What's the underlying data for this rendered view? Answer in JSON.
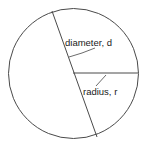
{
  "figure": {
    "background_color": "#ffffff",
    "stroke_color": "#4a4a4a",
    "text_color": "#1a1a1a",
    "width": 149,
    "height": 149,
    "circle": {
      "name": "circle-outline",
      "center_x": 73.5,
      "center_y": 73.5,
      "radius": 65
    },
    "diameter": {
      "label": "diameter, d",
      "symbol": "d",
      "x1": 52,
      "y1": 11,
      "x2": 97,
      "y2": 137,
      "label_x": 65,
      "label_y": 46,
      "leader_x1": 69,
      "leader_y1": 57,
      "leader_x2": 82,
      "leader_y2": 53,
      "leader_x3": 95,
      "leader_y3": 48
    },
    "radius": {
      "label": "radius, r",
      "symbol": "r",
      "x1": 73,
      "y1": 73,
      "x2": 138,
      "y2": 73,
      "label_x": 83,
      "label_y": 95,
      "leader_x1": 96,
      "leader_y1": 86,
      "leader_x2": 106,
      "leader_y2": 75
    }
  }
}
